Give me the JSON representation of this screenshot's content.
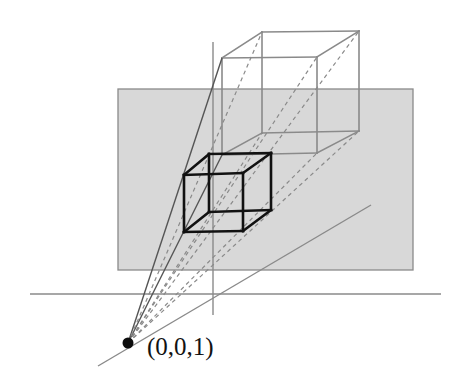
{
  "figure": {
    "type": "geometry-diagram",
    "canvas": {
      "width": 467,
      "height": 388,
      "background": "#ffffff"
    },
    "colors": {
      "plane_fill": "#d8d8d8",
      "plane_stroke": "#8a8a8a",
      "axis": "#8a8a8a",
      "near_cube": "#111111",
      "far_cube": "#8a8a8a",
      "ray_solid": "#555555",
      "ray_dashed": "#8a8a8a",
      "eye_point": "#0d0d0d",
      "label": "#121212"
    },
    "labels": [
      {
        "name": "eye-point-label",
        "text": "(0,0,1)",
        "x": 147,
        "y": 355,
        "font_size": 25
      }
    ],
    "eye_point": {
      "name": "center-of-projection",
      "label": "(0,0,1)",
      "x": 128,
      "y": 343,
      "radius": 5.5
    },
    "axes": [
      {
        "name": "horizontal-axis",
        "orientation": "horizontal",
        "x1": 30,
        "y1": 294,
        "x2": 441,
        "y2": 294
      },
      {
        "name": "vertical-axis",
        "orientation": "vertical",
        "x1": 213,
        "y1": 42,
        "x2": 213,
        "y2": 315
      },
      {
        "name": "depth-axis",
        "orientation": "diagonal",
        "x1": 98,
        "y1": 366,
        "x2": 371,
        "y2": 205
      }
    ],
    "image_plane": {
      "name": "projection-plane",
      "x": 118,
      "y": 89,
      "width": 295,
      "height": 181,
      "fill": "#d8d8d8",
      "stroke": "#8a8a8a"
    },
    "near_cube": {
      "name": "projected-cube",
      "stroke_width": 2.6,
      "vertices": {
        "front_top_left": [
          184,
          175
        ],
        "front_top_right": [
          243,
          173
        ],
        "front_bottom_right": [
          243,
          231
        ],
        "front_bottom_left": [
          184,
          232
        ],
        "back_top_left": [
          209,
          154
        ],
        "back_top_right": [
          271,
          153
        ],
        "back_bottom_right": [
          271,
          210
        ],
        "back_bottom_left": [
          209,
          212
        ]
      }
    },
    "far_cube": {
      "name": "source-cube",
      "stroke_width": 1.6,
      "vertices": {
        "front_top_left": [
          222,
          58
        ],
        "front_top_right": [
          317,
          57
        ],
        "front_bottom_right": [
          317,
          153
        ],
        "front_bottom_left": [
          222,
          155
        ],
        "back_top_left": [
          262,
          32
        ],
        "back_top_right": [
          359,
          31
        ],
        "back_bottom_right": [
          359,
          131
        ],
        "back_bottom_left": [
          262,
          133
        ]
      }
    },
    "projection_rays": [
      {
        "name": "ray-front-top-left",
        "style": "solid",
        "to": [
          222,
          58
        ]
      },
      {
        "name": "ray-front-top-right",
        "style": "dashed",
        "to": [
          317,
          57
        ]
      },
      {
        "name": "ray-front-bottom-right",
        "style": "dashed",
        "to": [
          317,
          153
        ]
      },
      {
        "name": "ray-front-bottom-left",
        "style": "solid",
        "to": [
          222,
          155
        ]
      },
      {
        "name": "ray-back-top-left",
        "style": "dashed",
        "to": [
          262,
          32
        ]
      },
      {
        "name": "ray-back-top-right",
        "style": "dashed",
        "to": [
          359,
          31
        ]
      },
      {
        "name": "ray-back-bottom-right",
        "style": "dashed",
        "to": [
          359,
          131
        ]
      },
      {
        "name": "ray-back-bottom-left",
        "style": "dashed",
        "to": [
          262,
          133
        ]
      }
    ]
  }
}
